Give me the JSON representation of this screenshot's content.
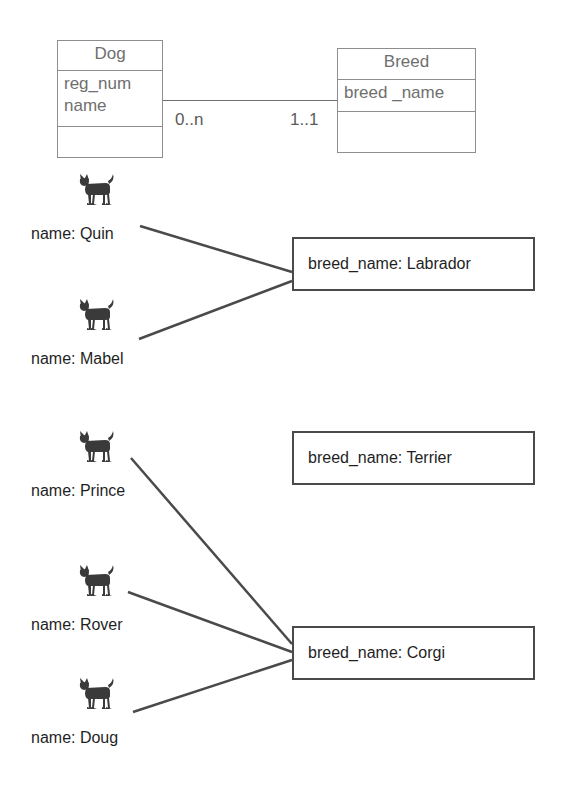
{
  "diagram": {
    "stroke_color": "#4a4a4a",
    "class_stroke_color": "#8e8e8e",
    "class_text_color": "#6f6f6f",
    "text_color": "#1f1f1f",
    "background": "#ffffff"
  },
  "class_diagram": {
    "classes": [
      {
        "id": "dog-class",
        "name": "Dog",
        "attributes": "reg_num\nname",
        "operations": ""
      },
      {
        "id": "breed-class",
        "name": "Breed",
        "attributes": "breed _name",
        "operations": ""
      }
    ],
    "association": {
      "source_multiplicity": "0..n",
      "target_multiplicity": "1..1"
    }
  },
  "object_diagram": {
    "dog_instances": [
      {
        "id": "quin",
        "label": "name: Quin",
        "icon": "dog-icon"
      },
      {
        "id": "mabel",
        "label": "name: Mabel",
        "icon": "dog-icon"
      },
      {
        "id": "prince",
        "label": "name: Prince",
        "icon": "dog-icon"
      },
      {
        "id": "rover",
        "label": "name: Rover",
        "icon": "dog-icon"
      },
      {
        "id": "doug",
        "label": "name: Doug",
        "icon": "dog-icon"
      }
    ],
    "breed_instances": [
      {
        "id": "labrador",
        "label": "breed_name: Labrador"
      },
      {
        "id": "terrier",
        "label": "breed_name: Terrier"
      },
      {
        "id": "corgi",
        "label": "breed_name: Corgi"
      }
    ],
    "links": [
      {
        "from": "quin",
        "to": "labrador"
      },
      {
        "from": "mabel",
        "to": "labrador"
      },
      {
        "from": "prince",
        "to": "corgi"
      },
      {
        "from": "rover",
        "to": "corgi"
      },
      {
        "from": "doug",
        "to": "corgi"
      }
    ]
  }
}
